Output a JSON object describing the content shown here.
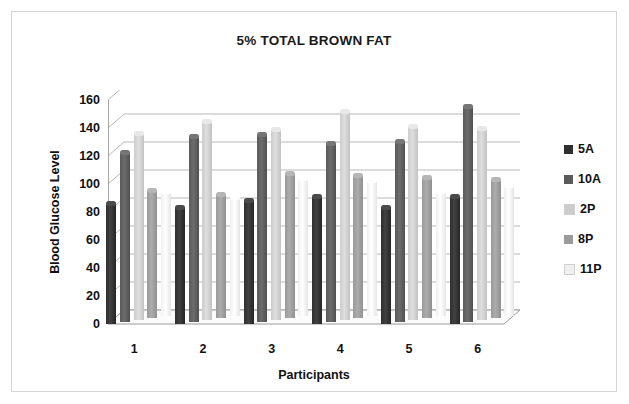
{
  "chart_data": {
    "type": "bar",
    "title": "5% TOTAL BROWN FAT",
    "xlabel": "Participants",
    "ylabel": "Blood Glucose Level",
    "categories": [
      "1",
      "2",
      "3",
      "4",
      "5",
      "6"
    ],
    "series": [
      {
        "name": "5A",
        "color": "#2f2f2f",
        "values": [
          88,
          85,
          90,
          93,
          85,
          93
        ]
      },
      {
        "name": "10A",
        "color": "#5a5a5a",
        "values": [
          123,
          134,
          136,
          129,
          131,
          156
        ]
      },
      {
        "name": "2P",
        "color": "#cccccc",
        "values": [
          135,
          144,
          138,
          151,
          140,
          139
        ]
      },
      {
        "name": "8P",
        "color": "#9a9a9a",
        "values": [
          93,
          90,
          105,
          104,
          102,
          101
        ]
      },
      {
        "name": "11P",
        "color": "#efefef",
        "values": [
          91,
          87,
          100,
          99,
          91,
          95
        ]
      }
    ],
    "ylim": [
      0,
      160
    ],
    "yticks": [
      0,
      20,
      40,
      60,
      80,
      100,
      120,
      140,
      160
    ],
    "grid": true,
    "legend_position": "right",
    "style_3d": true
  }
}
